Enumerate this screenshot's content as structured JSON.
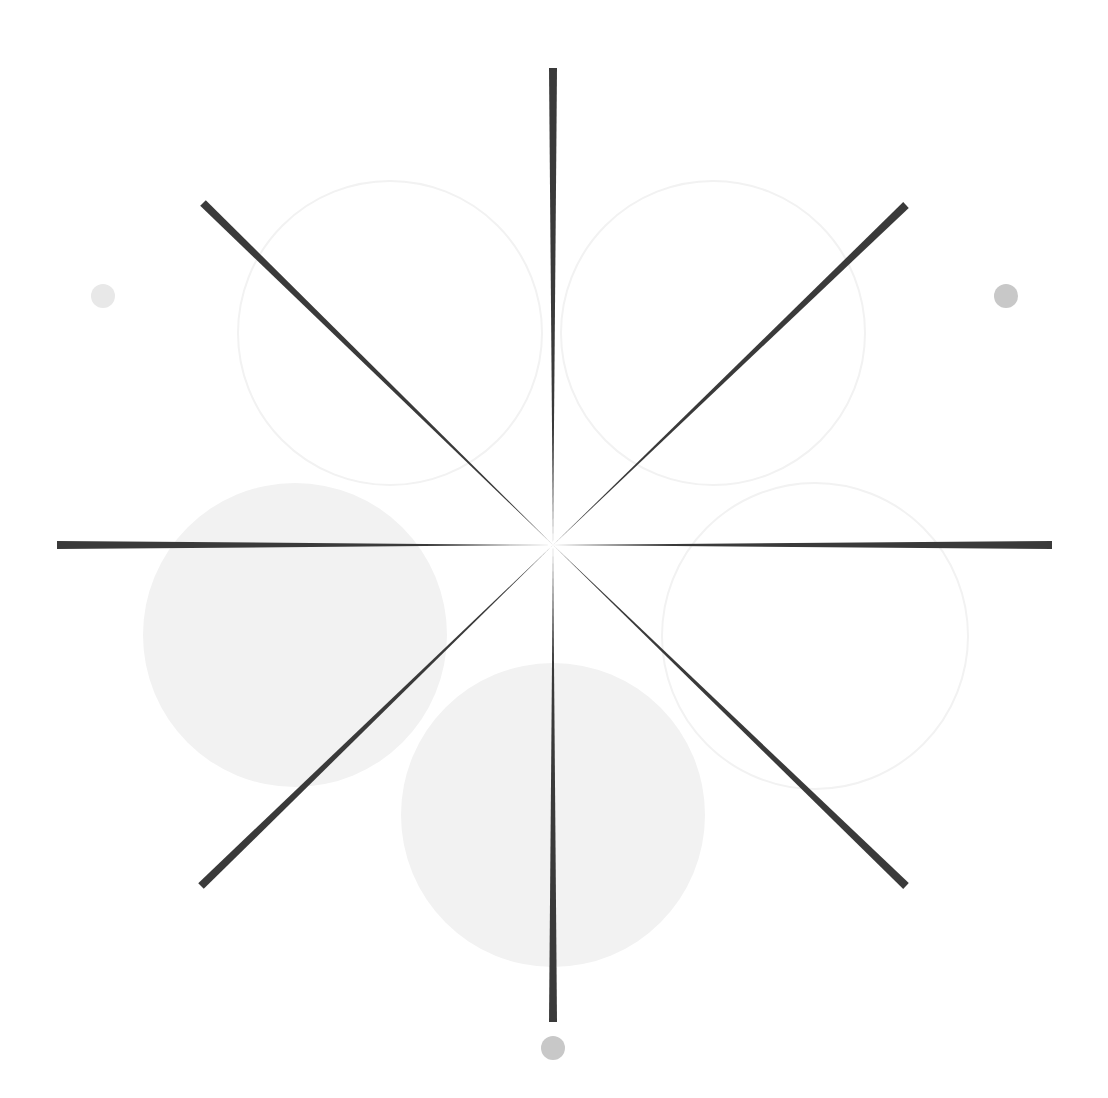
{
  "canvas": {
    "width": 1108,
    "height": 1098,
    "background_color": "#ffffff",
    "title": "Radial Starburst Figure"
  },
  "figure": {
    "name": "eight-spoke-radial-burst",
    "center_x": 553,
    "center_y": 545
  },
  "palette": {
    "spoke_color": "#3a3a3a",
    "circle_fill_color": "#f2f2f2",
    "circle_stroke_color": "#f2f2f2",
    "dot_color_dark": "#c8c8c8",
    "dot_color_light": "#e8e8e8",
    "background": "#ffffff"
  },
  "chart_data": {
    "type": "scatter",
    "subtitle": "",
    "xlabel": "",
    "ylabel": "",
    "xlim": [
      0,
      1108
    ],
    "ylim": [
      0,
      1098
    ],
    "grid": false,
    "legend_position": "none",
    "center": [
      553,
      545
    ],
    "spoke_count": 8,
    "spoke_length": 485,
    "spoke_tip_width": 8,
    "spoke_taper": "linear-to-zero-at-center",
    "spokes": [
      {
        "label": "spoke-n",
        "angle_deg": 270,
        "x1": 553,
        "y1": 545,
        "x2": 553,
        "y2": 68,
        "tip_width": 8
      },
      {
        "label": "spoke-ne",
        "angle_deg": 315,
        "x1": 553,
        "y1": 545,
        "x2": 906,
        "y2": 205,
        "tip_width": 8
      },
      {
        "label": "spoke-e",
        "angle_deg": 0,
        "x1": 553,
        "y1": 545,
        "x2": 1052,
        "y2": 545,
        "tip_width": 8
      },
      {
        "label": "spoke-se",
        "angle_deg": 45,
        "x1": 553,
        "y1": 545,
        "x2": 906,
        "y2": 886,
        "tip_width": 8
      },
      {
        "label": "spoke-s",
        "angle_deg": 90,
        "x1": 553,
        "y1": 545,
        "x2": 553,
        "y2": 1022,
        "tip_width": 8
      },
      {
        "label": "spoke-sw",
        "angle_deg": 135,
        "x1": 553,
        "y1": 545,
        "x2": 201,
        "y2": 886,
        "tip_width": 8
      },
      {
        "label": "spoke-w",
        "angle_deg": 180,
        "x1": 553,
        "y1": 545,
        "x2": 57,
        "y2": 545,
        "tip_width": 8
      },
      {
        "label": "spoke-nw",
        "angle_deg": 225,
        "x1": 553,
        "y1": 545,
        "x2": 203,
        "y2": 203,
        "tip_width": 8
      }
    ],
    "large_circles": [
      {
        "label": "circle-top-left",
        "cx": 390,
        "cy": 333,
        "r": 152,
        "style": "outline",
        "fill": "none",
        "stroke": "#f2f2f2",
        "stroke_width": 2
      },
      {
        "label": "circle-top-right",
        "cx": 713,
        "cy": 333,
        "r": 152,
        "style": "outline",
        "fill": "none",
        "stroke": "#f2f2f2",
        "stroke_width": 2
      },
      {
        "label": "circle-right",
        "cx": 815,
        "cy": 636,
        "r": 153,
        "style": "outline",
        "fill": "none",
        "stroke": "#f2f2f2",
        "stroke_width": 2
      },
      {
        "label": "circle-left",
        "cx": 295,
        "cy": 635,
        "r": 152,
        "style": "filled",
        "fill": "#f2f2f2",
        "stroke": "none",
        "stroke_width": 0
      },
      {
        "label": "circle-bottom",
        "cx": 553,
        "cy": 815,
        "r": 152,
        "style": "filled",
        "fill": "#f2f2f2",
        "stroke": "none",
        "stroke_width": 0
      }
    ],
    "small_dots": [
      {
        "label": "dot-left",
        "cx": 103,
        "cy": 296,
        "r": 12,
        "fill": "#e8e8e8"
      },
      {
        "label": "dot-right",
        "cx": 1006,
        "cy": 296,
        "r": 12,
        "fill": "#c8c8c8"
      },
      {
        "label": "dot-bottom",
        "cx": 553,
        "cy": 1048,
        "r": 12,
        "fill": "#c8c8c8"
      }
    ]
  }
}
